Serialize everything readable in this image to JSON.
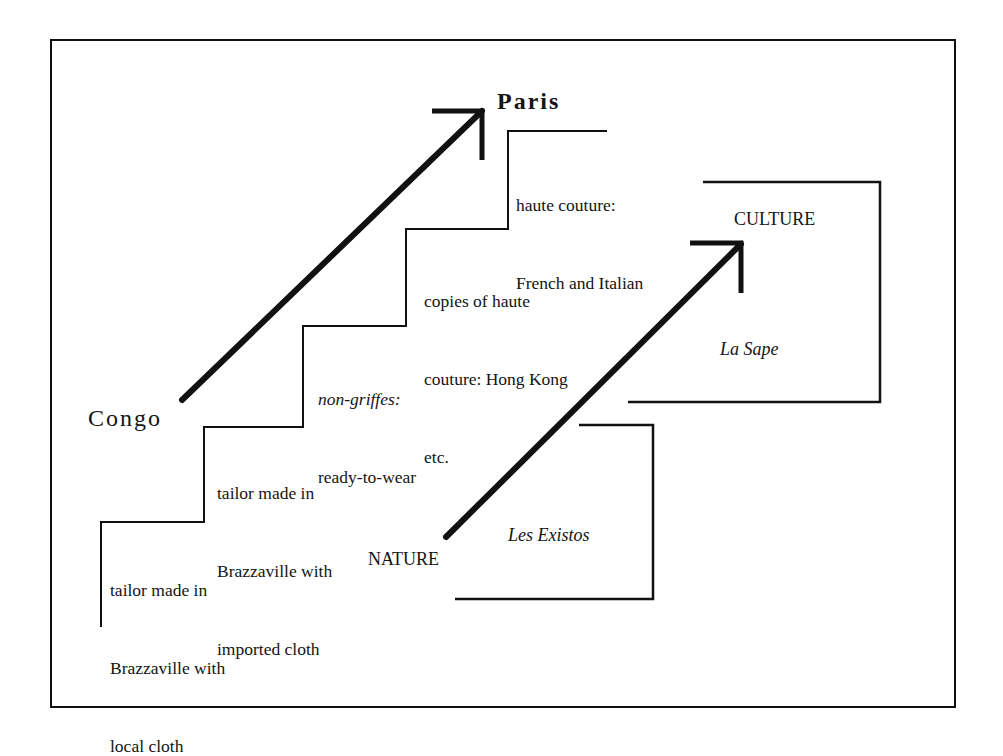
{
  "diagram": {
    "type": "staircase-diagram",
    "endpoints": {
      "start": "Congo",
      "end": "Paris"
    },
    "steps": [
      {
        "id": 1,
        "lines": [
          "tailor made in",
          "Brazzaville with",
          "local cloth"
        ]
      },
      {
        "id": 2,
        "lines": [
          "tailor made in",
          "Brazzaville with",
          "imported cloth"
        ]
      },
      {
        "id": 3,
        "lines_italic": "non-griffes:",
        "lines": [
          "ready-to-wear"
        ]
      },
      {
        "id": 4,
        "lines": [
          "copies of haute",
          "couture: Hong Kong",
          "etc."
        ]
      },
      {
        "id": 5,
        "lines": [
          "haute couture:",
          "French and Italian"
        ]
      }
    ],
    "axis": {
      "start": "NATURE",
      "end": "CULTURE"
    },
    "groups": {
      "upper": "La Sape",
      "lower": "Les Existos"
    },
    "colors": {
      "ink": "#111111",
      "background": "#ffffff"
    }
  }
}
